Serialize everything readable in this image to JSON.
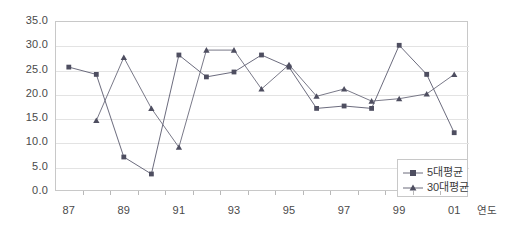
{
  "chart_data": {
    "type": "line",
    "title": "",
    "xlabel": "연도",
    "ylabel": "",
    "ylim": [
      0.0,
      35.0
    ],
    "ytick_step": 5.0,
    "yticks": [
      "35.0",
      "30.0",
      "25.0",
      "20.0",
      "15.0",
      "10.0",
      "5.0",
      "0.0"
    ],
    "ytick_values": [
      35.0,
      30.0,
      25.0,
      20.0,
      15.0,
      10.0,
      5.0,
      0.0
    ],
    "xticks": [
      "87",
      "89",
      "91",
      "93",
      "95",
      "97",
      "99",
      "01"
    ],
    "x": [
      "87",
      "88",
      "89",
      "90",
      "91",
      "92",
      "93",
      "94",
      "95",
      "96",
      "97",
      "98",
      "99",
      "00",
      "01"
    ],
    "grid": "horizontal",
    "legend_position": "bottom-right",
    "series": [
      {
        "name": "5대평균",
        "marker": "square",
        "color": "#5a5a6e",
        "values": [
          25.5,
          24.0,
          7.0,
          3.5,
          28.0,
          23.5,
          24.5,
          28.0,
          25.5,
          17.0,
          17.5,
          17.0,
          30.0,
          24.0,
          12.0
        ]
      },
      {
        "name": "30대평균",
        "marker": "triangle",
        "color": "#6a6a7a",
        "values": [
          null,
          14.5,
          27.5,
          17.0,
          9.0,
          29.0,
          29.0,
          21.0,
          26.0,
          19.5,
          21.0,
          18.5,
          19.0,
          20.0,
          24.0
        ]
      }
    ]
  },
  "legend": {
    "items": [
      {
        "label": "5대평균",
        "marker": "square"
      },
      {
        "label": "30대평균",
        "marker": "triangle"
      }
    ]
  }
}
